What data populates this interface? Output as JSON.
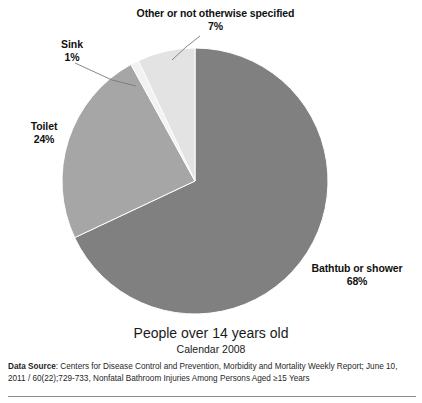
{
  "chart_data": {
    "type": "pie",
    "title": "People over 14 years old",
    "subtitle": "Calendar 2008",
    "categories": [
      "Bathtub or shower",
      "Toilet",
      "Sink",
      "Other or not otherwise specified"
    ],
    "values": [
      68,
      24,
      1,
      7
    ],
    "value_labels": [
      "68%",
      "24%",
      "1%",
      "7%"
    ],
    "units": "percent",
    "colors": [
      "#808080",
      "#a6a6a6",
      "#f2f2f2",
      "#e3e3e3"
    ],
    "legend": "none",
    "labels_position": "outside-with-leader-lines",
    "start_angle_deg": 0,
    "direction": "clockwise",
    "slices": [
      {
        "name": "Bathtub or shower",
        "percent": 68,
        "label": "Bathtub or shower",
        "pct_label": "68%",
        "color": "#808080"
      },
      {
        "name": "Toilet",
        "percent": 24,
        "label": "Toilet",
        "pct_label": "24%",
        "color": "#a6a6a6"
      },
      {
        "name": "Sink",
        "percent": 1,
        "label": "Sink",
        "pct_label": "1%",
        "color": "#f2f2f2"
      },
      {
        "name": "Other or not otherwise specified",
        "percent": 7,
        "label": "Other or not otherwise specified",
        "pct_label": "7%",
        "color": "#e3e3e3"
      }
    ]
  },
  "labels": {
    "other": {
      "name": "Other or not otherwise specified",
      "pct": "7%"
    },
    "sink": {
      "name": "Sink",
      "pct": "1%"
    },
    "toilet": {
      "name": "Toilet",
      "pct": "24%"
    },
    "bathtub": {
      "name": "Bathtub or shower",
      "pct": "68%"
    }
  },
  "titles": {
    "main": "People over 14 years old",
    "sub": "Calendar 2008"
  },
  "source": {
    "prefix": "Data Source",
    "separator": ": ",
    "text": "Centers for Disease Control and Prevention, Morbidity and Mortality Weekly Report; June 10, 2011 / 60(22);729-733, Nonfatal Bathroom Injuries Among Persons Aged ≥15 Years"
  }
}
